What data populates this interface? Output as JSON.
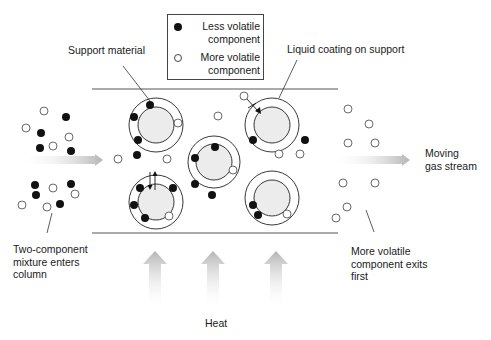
{
  "colors": {
    "line": "#555555",
    "dark_particle": "#111111",
    "light_particle_fill": "#ffffff",
    "light_particle_stroke": "#444444",
    "bead_fill": "#ececec",
    "arrow_gray": "#b8b8b8"
  },
  "legend": {
    "items": [
      {
        "symbol": "filled-circle",
        "label": "Less volatile component"
      },
      {
        "symbol": "open-circle",
        "label": "More volatile component"
      }
    ]
  },
  "labels": {
    "support_material": "Support material",
    "liquid_coating": "Liquid coating on support",
    "moving_gas_line1": "Moving",
    "moving_gas_line2": "gas stream",
    "mixture_line1": "Two-component",
    "mixture_line2": "mixture enters",
    "mixture_line3": "column",
    "exits_line1": "More volatile",
    "exits_line2": "component exits",
    "exits_line3": "first",
    "heat": "Heat"
  },
  "column": {
    "x1": 92,
    "x2": 338,
    "top_y": 89,
    "bottom_y": 233
  },
  "beads": [
    {
      "cx": 156,
      "cy": 125,
      "r_outer": 27,
      "r_inner": 18
    },
    {
      "cx": 156,
      "cy": 202,
      "r_outer": 27,
      "r_inner": 18
    },
    {
      "cx": 214,
      "cy": 162,
      "r_outer": 26,
      "r_inner": 18
    },
    {
      "cx": 272,
      "cy": 125,
      "r_outer": 27,
      "r_inner": 18
    },
    {
      "cx": 272,
      "cy": 198,
      "r_outer": 27,
      "r_inner": 18
    }
  ],
  "particles": {
    "dark": [
      [
        66,
        117
      ],
      [
        41,
        133
      ],
      [
        40,
        148
      ],
      [
        71,
        151
      ],
      [
        35,
        185
      ],
      [
        71,
        184
      ],
      [
        36,
        195
      ],
      [
        60,
        204
      ],
      [
        150,
        105
      ],
      [
        134,
        117
      ],
      [
        138,
        140
      ],
      [
        137,
        155
      ],
      [
        140,
        188
      ],
      [
        173,
        188
      ],
      [
        134,
        205
      ],
      [
        145,
        218
      ],
      [
        215,
        147
      ],
      [
        195,
        158
      ],
      [
        195,
        184
      ],
      [
        212,
        195
      ],
      [
        253,
        140
      ],
      [
        305,
        140
      ],
      [
        253,
        205
      ],
      [
        258,
        215
      ]
    ],
    "light": [
      [
        44,
        111
      ],
      [
        26,
        128
      ],
      [
        69,
        137
      ],
      [
        53,
        146
      ],
      [
        53,
        188
      ],
      [
        75,
        194
      ],
      [
        22,
        205
      ],
      [
        47,
        207
      ],
      [
        178,
        123
      ],
      [
        167,
        159
      ],
      [
        169,
        216
      ],
      [
        218,
        116
      ],
      [
        233,
        170
      ],
      [
        279,
        154
      ],
      [
        300,
        154
      ],
      [
        118,
        159
      ],
      [
        244,
        96
      ],
      [
        287,
        214
      ],
      [
        348,
        109
      ],
      [
        369,
        124
      ],
      [
        348,
        143
      ],
      [
        375,
        143
      ],
      [
        343,
        183
      ],
      [
        375,
        183
      ],
      [
        347,
        207
      ],
      [
        336,
        218
      ]
    ]
  },
  "arrows": {
    "flow_in": {
      "x1": 20,
      "x2": 103,
      "y": 160
    },
    "flow_out": {
      "x1": 333,
      "x2": 410,
      "y": 160
    },
    "heat_xs": [
      155,
      213,
      276
    ],
    "heat_top": 251,
    "heat_bottom": 310
  }
}
